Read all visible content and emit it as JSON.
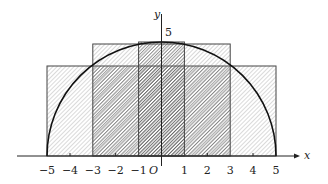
{
  "diagram": {
    "axes": {
      "x_label": "x",
      "y_label": "y",
      "origin_label": "O",
      "y_tick_label": "5",
      "x_ticks": [
        "−5",
        "−4",
        "−3",
        "−2",
        "−1",
        "1",
        "2",
        "3",
        "4",
        "5"
      ],
      "x_tick_values": [
        -5,
        -4,
        -3,
        -2,
        -1,
        1,
        2,
        3,
        4,
        5
      ]
    },
    "curve": {
      "type": "semicircle",
      "radius": 5,
      "equation": "y = sqrt(25 - x^2)"
    },
    "rectangles": [
      {
        "x_from": -5,
        "x_to": 5,
        "height": 4
      },
      {
        "x_from": -4,
        "x_to": 4,
        "height": 3
      },
      {
        "x_from": -3,
        "x_to": 3,
        "height": 4.9
      },
      {
        "x_from": -1,
        "x_to": 1,
        "height": 5
      }
    ]
  }
}
